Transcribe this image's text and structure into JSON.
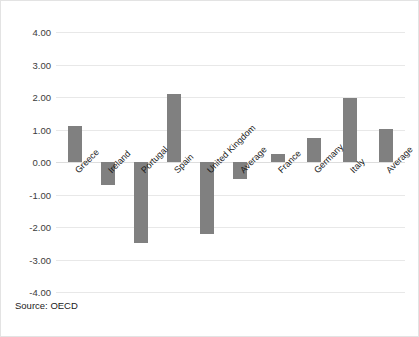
{
  "figure": {
    "source_note": "Source: OECD",
    "bar_color": "#808080",
    "grid_color": "#e8e8e8",
    "background": "#ffffff"
  },
  "chart_data": {
    "type": "bar",
    "title": "",
    "subtitle": "",
    "xlabel": "",
    "ylabel": "",
    "ylim": [
      -4.0,
      4.0
    ],
    "ytick_values": [
      4.0,
      3.0,
      2.0,
      1.0,
      0.0,
      -1.0,
      -2.0,
      -3.0,
      -4.0
    ],
    "ytick_labels": [
      "4.00",
      "3.00",
      "2.00",
      "1.00",
      "0.00",
      "-1.00",
      "-2.00",
      "-3.00",
      "-4.00"
    ],
    "grid": true,
    "legend": false,
    "legend_position": "none",
    "annotations": [
      "Source: OECD"
    ],
    "groups": [
      {
        "name": "group-1",
        "categories": [
          "Greece",
          "Ireland",
          "Portugal",
          "Spain",
          "United Kingdom",
          "Average"
        ],
        "values": [
          1.12,
          -0.72,
          -2.5,
          2.08,
          -2.22,
          -0.52
        ]
      },
      {
        "name": "group-2",
        "categories": [
          "France",
          "Germany",
          "Italy",
          "Average"
        ],
        "values": [
          0.25,
          0.75,
          1.98,
          1.03
        ]
      }
    ],
    "categories": [
      "Greece",
      "Ireland",
      "Portugal",
      "Spain",
      "United Kingdom",
      "Average",
      "France",
      "Germany",
      "Italy",
      "Average"
    ],
    "values": [
      1.12,
      -0.72,
      -2.5,
      2.08,
      -2.22,
      -0.52,
      0.25,
      0.75,
      1.98,
      1.03
    ]
  }
}
